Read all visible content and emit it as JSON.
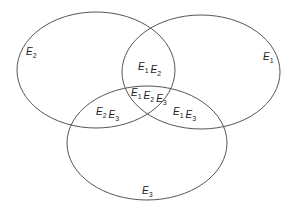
{
  "diagram": {
    "type": "venn",
    "sets": [
      {
        "id": "E1",
        "base": "E",
        "sub": "1",
        "cx": 201,
        "cy": 72,
        "rx": 79,
        "ry": 57,
        "label_x": 263,
        "label_y": 60
      },
      {
        "id": "E2",
        "base": "E",
        "sub": "2",
        "cx": 96,
        "cy": 70,
        "rx": 79,
        "ry": 58,
        "label_x": 26,
        "label_y": 55
      },
      {
        "id": "E3",
        "base": "E",
        "sub": "3",
        "cx": 147,
        "cy": 143,
        "rx": 80,
        "ry": 57,
        "label_x": 142,
        "label_y": 194
      }
    ],
    "regions": [
      {
        "id": "E1E2",
        "parts": [
          {
            "base": "E",
            "sub": "1"
          },
          {
            "base": "E",
            "sub": "2"
          }
        ],
        "x": 138,
        "y": 70
      },
      {
        "id": "E1E2E3",
        "parts": [
          {
            "base": "E",
            "sub": "1"
          },
          {
            "base": "E",
            "sub": "2"
          },
          {
            "base": "E",
            "sub": "3"
          }
        ],
        "x": 131,
        "y": 96
      },
      {
        "id": "E2E3",
        "parts": [
          {
            "base": "E",
            "sub": "2"
          },
          {
            "base": "E",
            "sub": "3"
          }
        ],
        "x": 96,
        "y": 115
      },
      {
        "id": "E1E3",
        "parts": [
          {
            "base": "E",
            "sub": "1"
          },
          {
            "base": "E",
            "sub": "3"
          }
        ],
        "x": 173,
        "y": 115
      }
    ],
    "stroke_color": "#555555",
    "text_color": "#222222"
  }
}
